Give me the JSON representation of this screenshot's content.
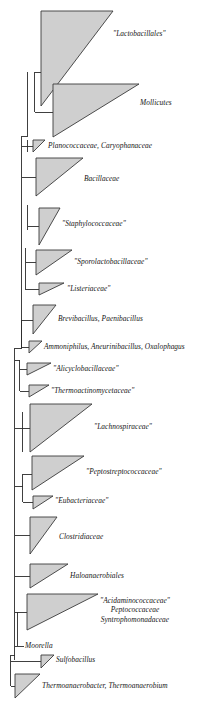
{
  "figure": {
    "type": "phylogenetic-tree",
    "width": 219,
    "height": 702,
    "background_color": "#ffffff",
    "wedge_fill_color": "#cfcfcf",
    "wedge_stroke_color": "#3a3a3a",
    "branch_color": "#2b2b2b",
    "label_color": "#151515"
  },
  "chart_data": {
    "type": "tree",
    "title": "",
    "taxa": [
      {
        "id": "lactobacillales",
        "label": "\"Lactobacillales\"",
        "label_x": 113,
        "label_y": 35
      },
      {
        "id": "mollicutes",
        "label": "Mollicutes",
        "label_x": 140,
        "label_y": 104
      },
      {
        "id": "planococcaceae",
        "label": "Planococcaceae, Caryophanaceae",
        "label_x": 48,
        "label_y": 145
      },
      {
        "id": "bacillaceae",
        "label": "Bacillaceae",
        "label_x": 84,
        "label_y": 180
      },
      {
        "id": "staphylococcaceae",
        "label": "\"Staphylococcaceae\"",
        "label_x": 62,
        "label_y": 224
      },
      {
        "id": "sporolactobacillaceae",
        "label": "\"Sporolactobacillaceae\"",
        "label_x": 74,
        "label_y": 262
      },
      {
        "id": "listeriaceae",
        "label": "\"Listeriaceae\"",
        "label_x": 67,
        "label_y": 288
      },
      {
        "id": "brevibacillus",
        "label": "Brevibacillus, Paenibacillus",
        "label_x": 58,
        "label_y": 318
      },
      {
        "id": "ammoniphilus",
        "label": "Ammoniphilus, Aneurinibacillus, Oxalophagus",
        "label_x": 44,
        "label_y": 347
      },
      {
        "id": "alicyclobacillaceae",
        "label": "\"Alicyclobacillaceae\"",
        "label_x": 53,
        "label_y": 369
      },
      {
        "id": "thermoactinomycetaceae",
        "label": "\"Thermoactinomycetaceae\"",
        "label_x": 51,
        "label_y": 391
      },
      {
        "id": "lachnospiraceae",
        "label": "\"Lachnospiraceae\"",
        "label_x": 94,
        "label_y": 427
      },
      {
        "id": "peptostreptococcaceae",
        "label": "\"Peptostreptococcaceae\"",
        "label_x": 86,
        "label_y": 472
      },
      {
        "id": "eubacteriaceae",
        "label": "\"Eubacteriaceae\"",
        "label_x": 55,
        "label_y": 500
      },
      {
        "id": "clostridiaceae",
        "label": "Clostridiaceae",
        "label_x": 59,
        "label_y": 537
      },
      {
        "id": "haloanaerobiales",
        "label": "Haloanaerobiales",
        "label_x": 70,
        "label_y": 576
      },
      {
        "id": "acidaminococcaceae",
        "label": "\"Acidaminococcaceae\"\nPeptococcaceae\nSyntrophomonadaceae",
        "label_x": 60,
        "label_y": 600
      },
      {
        "id": "moorella",
        "label": "Moorella",
        "label_x": 25,
        "label_y": 647
      },
      {
        "id": "sulfobacillus",
        "label": "Sulfobacillus",
        "label_x": 56,
        "label_y": 660
      },
      {
        "id": "thermoanaerobacter",
        "label": "Thermoanaerobacter, Thermoanaerobium",
        "label_x": 42,
        "label_y": 687
      }
    ],
    "wedges": [
      {
        "id": "lactobacillales",
        "apex_x": 41,
        "apex_y": 72,
        "top_y": 11,
        "bottom_y": 106,
        "right_x": 113
      },
      {
        "id": "mollicutes",
        "apex_x": 53,
        "apex_y": 88,
        "top_y": 84,
        "bottom_y": 137,
        "right_x": 139
      },
      {
        "id": "planococcaceae",
        "apex_x": 33,
        "apex_y": 146,
        "top_y": 140,
        "bottom_y": 152,
        "right_x": 45
      },
      {
        "id": "bacillaceae",
        "apex_x": 36,
        "apex_y": 196,
        "top_y": 158,
        "bottom_y": 196,
        "right_x": 83
      },
      {
        "id": "staphylococcaceae",
        "apex_x": 39,
        "apex_y": 208,
        "top_y": 208,
        "bottom_y": 245,
        "right_x": 60
      },
      {
        "id": "sporolactobacillaceae",
        "apex_x": 36,
        "apex_y": 275,
        "top_y": 250,
        "bottom_y": 275,
        "right_x": 72
      },
      {
        "id": "listeriaceae",
        "apex_x": 39,
        "apex_y": 295,
        "top_y": 283,
        "bottom_y": 295,
        "right_x": 64
      },
      {
        "id": "brevibacillus",
        "apex_x": 33,
        "apex_y": 334,
        "top_y": 305,
        "bottom_y": 334,
        "right_x": 56
      },
      {
        "id": "ammoniphilus",
        "apex_x": 29,
        "apex_y": 353,
        "top_y": 341,
        "bottom_y": 353,
        "right_x": 42
      },
      {
        "id": "alicyclobacillaceae",
        "apex_x": 27,
        "apex_y": 375,
        "top_y": 363,
        "bottom_y": 375,
        "right_x": 51
      },
      {
        "id": "thermoactinomycetaceae",
        "apex_x": 29,
        "apex_y": 397,
        "top_y": 385,
        "bottom_y": 397,
        "right_x": 49
      },
      {
        "id": "lachnospiraceae",
        "apex_x": 30,
        "apex_y": 412,
        "top_y": 404,
        "bottom_y": 452,
        "right_x": 92
      },
      {
        "id": "peptostreptococcaceae",
        "apex_x": 32,
        "apex_y": 490,
        "top_y": 456,
        "bottom_y": 490,
        "right_x": 84
      },
      {
        "id": "eubacteriaceae",
        "apex_x": 33,
        "apex_y": 496,
        "top_y": 496,
        "bottom_y": 509,
        "right_x": 53
      },
      {
        "id": "clostridiaceae",
        "apex_x": 30,
        "apex_y": 554,
        "top_y": 517,
        "bottom_y": 554,
        "right_x": 57
      },
      {
        "id": "haloanaerobiales",
        "apex_x": 30,
        "apex_y": 588,
        "top_y": 564,
        "bottom_y": 588,
        "right_x": 68
      },
      {
        "id": "acidaminococcaceae",
        "apex_x": 27,
        "apex_y": 630,
        "top_y": 594,
        "bottom_y": 630,
        "right_x": 98
      },
      {
        "id": "sulfobacillus",
        "apex_x": 41,
        "apex_y": 655,
        "top_y": 655,
        "bottom_y": 668,
        "right_x": 54
      },
      {
        "id": "thermoanaerobacter",
        "apex_x": 15,
        "apex_y": 698,
        "top_y": 674,
        "bottom_y": 698,
        "right_x": 40
      }
    ]
  }
}
